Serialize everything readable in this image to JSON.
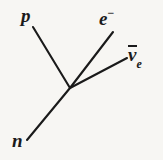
{
  "figure": {
    "kind": "feynman-vertex-diagram",
    "background_color": "#f7f6f3",
    "stroke_color": "#1a1a1a",
    "width": 163,
    "height": 160
  },
  "vertex": {
    "x": 70,
    "y": 88
  },
  "lines": [
    {
      "id": "proton-line",
      "particle": "p",
      "x1": 33,
      "y1": 27,
      "x2": 70,
      "y2": 88,
      "stroke_width": 2.1
    },
    {
      "id": "neutron-line",
      "particle": "n",
      "x1": 27,
      "y1": 140,
      "x2": 70,
      "y2": 88,
      "stroke_width": 2.1
    },
    {
      "id": "electron-line",
      "particle": "e-",
      "x1": 70,
      "y1": 88,
      "x2": 113,
      "y2": 32,
      "stroke_width": 2.1
    },
    {
      "id": "antineutrino-line",
      "particle": "nu-bar-e",
      "x1": 70,
      "y1": 88,
      "x2": 127,
      "y2": 58,
      "stroke_width": 2.1
    }
  ],
  "labels": {
    "proton": {
      "text": "p"
    },
    "neutron": {
      "text": "n"
    },
    "electron": {
      "base": "e",
      "superscript": "−"
    },
    "antineutrino": {
      "base": "v",
      "overbar": true,
      "subscript": "e"
    }
  }
}
